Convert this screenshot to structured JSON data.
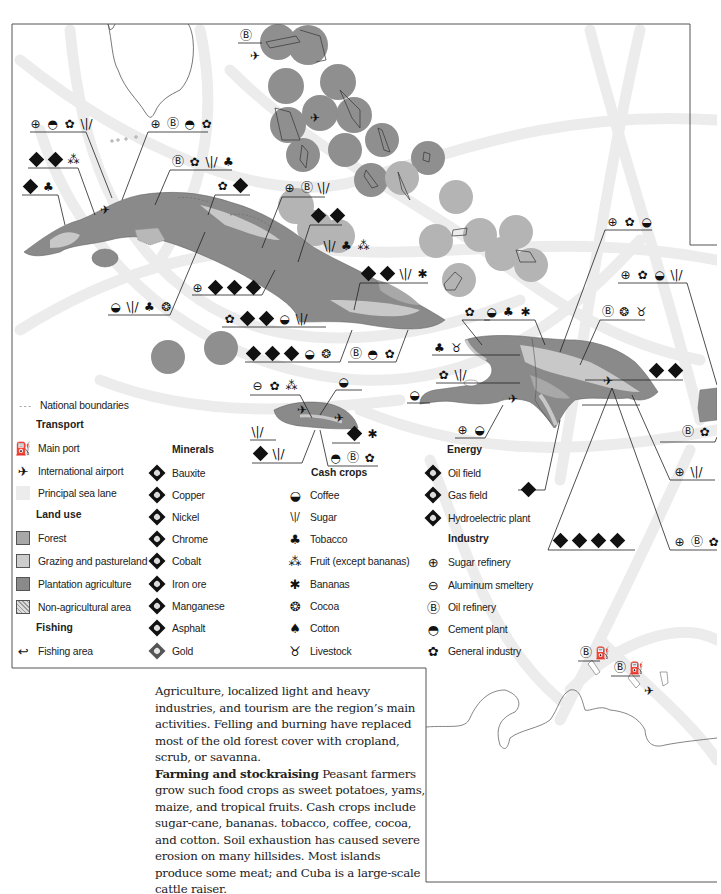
{
  "map": {
    "region": "Caribbean (Greater Antilles)",
    "colors": {
      "forest": "#a8a8a8",
      "grazing": "#cdcdcd",
      "plantation": "#8a8a8a",
      "non_agricultural": "#b8b8b8",
      "sea_lane": "#ececec",
      "frame": "#555555",
      "fishing_circle": "#8f8f8f",
      "fishing_circle_light": "#b4b4b4"
    }
  },
  "legend": {
    "national_boundaries": "National boundaries",
    "transport": {
      "heading": "Transport",
      "items": [
        {
          "icon": "main-port-icon",
          "label": "Main port"
        },
        {
          "icon": "airport-icon",
          "label": "International airport"
        },
        {
          "icon": "sea-lane-swatch",
          "label": "Principal sea lane"
        }
      ]
    },
    "land_use": {
      "heading": "Land use",
      "items": [
        {
          "icon": "forest-swatch",
          "label": "Forest"
        },
        {
          "icon": "grazing-swatch",
          "label": "Grazing and pastureland"
        },
        {
          "icon": "plantation-swatch",
          "label": "Plantation agriculture"
        },
        {
          "icon": "non-agricultural-swatch",
          "label": "Non-agricultural area"
        }
      ]
    },
    "fishing": {
      "heading": "Fishing",
      "items": [
        {
          "icon": "fishing-icon",
          "label": "Fishing area"
        }
      ]
    },
    "minerals": {
      "heading": "Minerals",
      "items": [
        {
          "icon": "bauxite-icon",
          "label": "Bauxite"
        },
        {
          "icon": "copper-icon",
          "label": "Copper"
        },
        {
          "icon": "nickel-icon",
          "label": "Nickel"
        },
        {
          "icon": "chrome-icon",
          "label": "Chrome"
        },
        {
          "icon": "cobalt-icon",
          "label": "Cobalt"
        },
        {
          "icon": "iron-ore-icon",
          "label": "Iron ore"
        },
        {
          "icon": "manganese-icon",
          "label": "Manganese"
        },
        {
          "icon": "asphalt-icon",
          "label": "Asphalt"
        },
        {
          "icon": "gold-icon",
          "label": "Gold"
        }
      ]
    },
    "cash_crops": {
      "heading": "Cash crops",
      "items": [
        {
          "icon": "coffee-icon",
          "label": "Coffee"
        },
        {
          "icon": "sugar-icon",
          "label": "Sugar"
        },
        {
          "icon": "tobacco-icon",
          "label": "Tobacco"
        },
        {
          "icon": "fruit-icon",
          "label": "Fruit (except bananas)"
        },
        {
          "icon": "bananas-icon",
          "label": "Bananas"
        },
        {
          "icon": "cocoa-icon",
          "label": "Cocoa"
        },
        {
          "icon": "cotton-icon",
          "label": "Cotton"
        },
        {
          "icon": "livestock-icon",
          "label": "Livestock"
        }
      ]
    },
    "energy": {
      "heading": "Energy",
      "items": [
        {
          "icon": "oil-field-icon",
          "label": "Oil field"
        },
        {
          "icon": "gas-field-icon",
          "label": "Gas field"
        },
        {
          "icon": "hydroelectric-icon",
          "label": "Hydroelectric plant"
        }
      ]
    },
    "industry": {
      "heading": "Industry",
      "items": [
        {
          "icon": "sugar-refinery-icon",
          "label": "Sugar refinery"
        },
        {
          "icon": "aluminum-smeltery-icon",
          "label": "Aluminum smeltery"
        },
        {
          "icon": "oil-refinery-icon",
          "label": "Oil refinery"
        },
        {
          "icon": "cement-plant-icon",
          "label": "Cement plant"
        },
        {
          "icon": "general-industry-icon",
          "label": "General industry"
        }
      ]
    }
  },
  "glyphs": {
    "main_port": "⛽",
    "airport": "✈",
    "coffee": "◒",
    "sugar": "\\|/",
    "tobacco": "♣",
    "fruit": "⁂",
    "bananas": "✱",
    "cocoa": "❂",
    "cotton": "♠",
    "livestock": "♉",
    "sugar_refinery": "⊕",
    "aluminum_smeltery": "⊖",
    "oil_refinery": "Ⓑ",
    "cement_plant": "◓",
    "general_industry": "✿",
    "fishing": "↩",
    "boundary": "- - -"
  },
  "text": {
    "paragraph1": "Agriculture, localized light and heavy industries, and tourism are the region’s main activities. Felling and burning have replaced most of the old forest cover with cropland, scrub, or savanna.",
    "heading2": "Farming and stockraising",
    "paragraph2": " Peasant farmers grow such food crops as sweet potatoes, yams, maize, and tropical fruits. Cash crops include sugar-cane, bananas. tobacco, coffee, cocoa, and cotton. Soil exhaustion has caused severe erosion on many hillsides. Most islands produce some meat; and Cuba is a large-scale cattle raiser."
  }
}
